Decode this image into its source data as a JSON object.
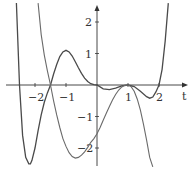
{
  "chart_data": {
    "type": "line",
    "title": "",
    "xlabel": "t",
    "ylabel": "",
    "xlim": [
      -3.1,
      3.0
    ],
    "ylim": [
      -2.6,
      2.6
    ],
    "grid": false,
    "x_ticks": [
      -2,
      -1,
      1,
      2
    ],
    "x_tick_labels": [
      "−2",
      "−1",
      "1",
      "2"
    ],
    "y_ticks": [
      2,
      1,
      -1,
      -2
    ],
    "y_tick_labels": [
      "2",
      "1",
      "−1",
      "−2"
    ],
    "series": [
      {
        "name": "curve-a",
        "description": "Polynomial with roots near -2.5, -1.5, 0, 1 (double), 2; local max ~1.1 near t=-1; min ~-2.5 near t=-2.15",
        "x": [
          -2.6,
          -2.5,
          -2.4,
          -2.3,
          -2.2,
          -2.15,
          -2.1,
          -2.0,
          -1.9,
          -1.8,
          -1.7,
          -1.6,
          -1.5,
          -1.4,
          -1.3,
          -1.2,
          -1.1,
          -1.0,
          -0.9,
          -0.8,
          -0.7,
          -0.6,
          -0.5,
          -0.4,
          -0.3,
          -0.2,
          -0.1,
          0.0,
          0.2,
          0.4,
          0.6,
          0.8,
          1.0,
          1.2,
          1.4,
          1.6,
          1.7,
          1.8,
          1.9,
          2.0,
          2.1,
          2.2,
          2.3
        ],
        "y": [
          2.6,
          0.0,
          -1.6,
          -2.3,
          -2.5,
          -2.5,
          -2.4,
          -2.0,
          -1.45,
          -0.95,
          -0.55,
          -0.25,
          0.0,
          0.35,
          0.65,
          0.9,
          1.05,
          1.1,
          1.05,
          0.92,
          0.74,
          0.55,
          0.37,
          0.22,
          0.11,
          0.04,
          0.01,
          0.0,
          -0.12,
          -0.15,
          -0.1,
          -0.03,
          0.0,
          -0.05,
          -0.2,
          -0.37,
          -0.42,
          -0.38,
          -0.22,
          0.0,
          0.5,
          1.4,
          2.6
        ]
      },
      {
        "name": "curve-b",
        "description": "Falls from top, crosses t=-1.5, min ~-2.3 near t=-0.7, ~-1.6 at t=0, touches 0 at t=1, then falls",
        "x": [
          -1.9,
          -1.8,
          -1.7,
          -1.6,
          -1.5,
          -1.4,
          -1.3,
          -1.2,
          -1.1,
          -1.0,
          -0.9,
          -0.8,
          -0.7,
          -0.6,
          -0.5,
          -0.4,
          -0.3,
          -0.2,
          -0.1,
          0.0,
          0.1,
          0.2,
          0.3,
          0.4,
          0.5,
          0.6,
          0.7,
          0.8,
          0.9,
          1.0,
          1.1,
          1.2,
          1.3,
          1.4,
          1.5,
          1.6,
          1.7,
          1.8
        ],
        "y": [
          2.6,
          1.6,
          0.95,
          0.45,
          0.0,
          -0.5,
          -0.95,
          -1.35,
          -1.7,
          -1.95,
          -2.15,
          -2.27,
          -2.32,
          -2.3,
          -2.23,
          -2.12,
          -1.98,
          -1.82,
          -1.7,
          -1.55,
          -1.35,
          -1.12,
          -0.9,
          -0.68,
          -0.48,
          -0.3,
          -0.16,
          -0.06,
          -0.01,
          0.0,
          -0.05,
          -0.2,
          -0.45,
          -0.8,
          -1.25,
          -1.75,
          -2.3,
          -2.6
        ]
      }
    ],
    "colors": {
      "axis": "#333333",
      "curve_a": "#4a4a4a",
      "curve_b": "#6a6a6a"
    }
  },
  "labels": {
    "t_axis": "t"
  }
}
